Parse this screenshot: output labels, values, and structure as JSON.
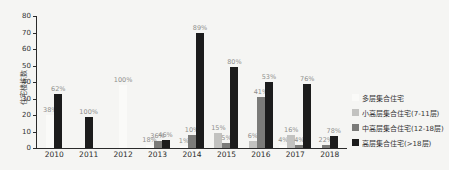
{
  "chart_data": {
    "type": "bar",
    "title": "",
    "xlabel": "",
    "ylabel": "住宅楼栋数",
    "ylim": [
      0,
      80
    ],
    "yticks": [
      0,
      10,
      20,
      30,
      40,
      50,
      60,
      70,
      80
    ],
    "grid": false,
    "legend_position": "right",
    "categories": [
      "2010",
      "2011",
      "2012",
      "2013",
      "2014",
      "2015",
      "2016",
      "2017",
      "2018"
    ],
    "series": [
      {
        "name": "多层集合住宅",
        "color": "#fafaf8",
        "values": [
          20,
          0,
          38,
          2,
          1,
          0,
          0,
          2,
          0
        ],
        "labels": [
          "38%",
          "",
          "100%",
          "18%",
          "1%",
          "",
          "",
          "4%",
          ""
        ]
      },
      {
        "name": "小高层集合住宅(7-11层)",
        "color": "#c2c2c0",
        "values": [
          0,
          0,
          0,
          0,
          0,
          9,
          4,
          8,
          0
        ],
        "labels": [
          "",
          "",
          "",
          "",
          "",
          "15%",
          "6%",
          "16%",
          ""
        ]
      },
      {
        "name": "中高层集合住宅(12-18层)",
        "color": "#7b7b79",
        "values": [
          0,
          0,
          0,
          4,
          8,
          3,
          31,
          2,
          2
        ],
        "labels": [
          "",
          "",
          "",
          "36%",
          "10%",
          "5%",
          "41%",
          "4%",
          "22%"
        ]
      },
      {
        "name": "高层集合住宅(>18层)",
        "color": "#1c1c1c",
        "values": [
          33,
          19,
          0,
          5,
          70,
          49,
          40,
          39,
          7
        ],
        "labels": [
          "62%",
          "100%",
          "",
          "46%",
          "89%",
          "80%",
          "53%",
          "76%",
          "78%"
        ]
      }
    ]
  }
}
